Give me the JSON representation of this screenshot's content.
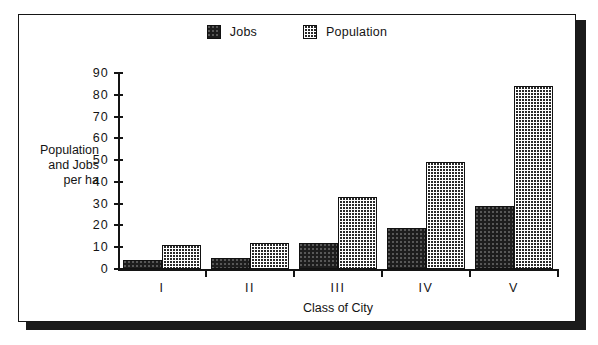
{
  "figure": {
    "legend": {
      "position": "top-center",
      "entries": [
        {
          "label": "Jobs",
          "swatch": "jobs-swatch",
          "color": "#1d1d1d"
        },
        {
          "label": "Population",
          "swatch": "population-swatch",
          "color": "#2a2a2a"
        }
      ]
    },
    "y_axis_title_lines": [
      "Population",
      "and Jobs",
      "per ha"
    ],
    "x_axis_title": "Class of City"
  },
  "chart_data": {
    "type": "bar",
    "title": "",
    "subtitle": "",
    "xlabel": "Class of City",
    "ylabel": "Population and Jobs per ha",
    "categories": [
      "I",
      "II",
      "III",
      "IV",
      "V"
    ],
    "series": [
      {
        "name": "Jobs",
        "values": [
          4,
          5,
          12,
          19,
          29
        ],
        "color": "#1d1d1d",
        "pattern": "dense-speckle"
      },
      {
        "name": "Population",
        "values": [
          11,
          12,
          33,
          49,
          84
        ],
        "color": "#2a2a2a",
        "pattern": "checkered"
      }
    ],
    "ylim": [
      0,
      90
    ],
    "yticks": [
      0,
      10,
      20,
      30,
      40,
      50,
      60,
      70,
      80,
      90
    ],
    "ytick_labels": [
      "0",
      "10",
      "20",
      "30",
      "40",
      "50",
      "60",
      "70",
      "80",
      "90"
    ],
    "grid": false,
    "legend_position": "top-center"
  }
}
